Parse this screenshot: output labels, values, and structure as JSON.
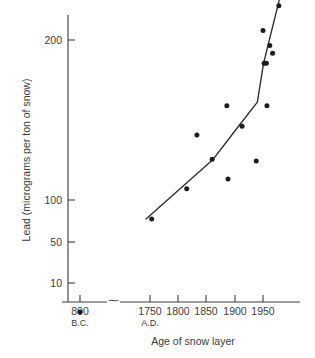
{
  "chart_data": {
    "type": "scatter",
    "title": "",
    "xlabel": "Age of snow layer",
    "ylabel": "Lead (micrograms per ton of snow)",
    "y_scale": "log",
    "ylim": [
      6,
      260
    ],
    "y_ticks": [
      10,
      50,
      100,
      200
    ],
    "y_tick_labels": [
      "10",
      "50",
      "100",
      "200"
    ],
    "x_ticks": [
      1750,
      1800,
      1850,
      1900,
      1950
    ],
    "x_tick_labels": [
      "1750",
      "1800",
      "1850",
      "1900",
      "1950"
    ],
    "x_era_left_label": "800",
    "x_era_left_sub": "B.C.",
    "x_era_right_sub": "A.D.",
    "axis_break_symbol": "⁓",
    "grid": false,
    "legend": "none",
    "points": [
      {
        "x": 800,
        "y": 7.0,
        "era": "BC"
      },
      {
        "x": 1753,
        "y": 22,
        "era": "AD"
      },
      {
        "x": 1815,
        "y": 32,
        "era": "AD"
      },
      {
        "x": 1833,
        "y": 62,
        "era": "AD"
      },
      {
        "x": 1860,
        "y": 46,
        "era": "AD"
      },
      {
        "x": 1886,
        "y": 89,
        "era": "AD"
      },
      {
        "x": 1888,
        "y": 36,
        "era": "AD"
      },
      {
        "x": 1913,
        "y": 69,
        "era": "AD"
      },
      {
        "x": 1938,
        "y": 45,
        "era": "AD"
      },
      {
        "x": 1952,
        "y": 150,
        "era": "AD"
      },
      {
        "x": 1956,
        "y": 150,
        "era": "AD"
      },
      {
        "x": 1957,
        "y": 89,
        "era": "AD"
      },
      {
        "x": 1950,
        "y": 225,
        "era": "AD"
      },
      {
        "x": 1962,
        "y": 187,
        "era": "AD"
      },
      {
        "x": 1967,
        "y": 170,
        "era": "AD"
      },
      {
        "x": 1978,
        "y": 305,
        "era": "AD"
      }
    ],
    "trend_vertices": [
      {
        "x": 1743,
        "y": 22
      },
      {
        "x": 1862,
        "y": 46
      },
      {
        "x": 1905,
        "y": 68
      },
      {
        "x": 1940,
        "y": 93
      },
      {
        "x": 1951,
        "y": 150
      },
      {
        "x": 1979,
        "y": 330
      }
    ],
    "colors": {
      "point": "#1c1c1c",
      "line": "#2b2b2b",
      "axis": "#3a3a3a",
      "text": "#3b3b3b",
      "background": "#ffffff"
    }
  }
}
